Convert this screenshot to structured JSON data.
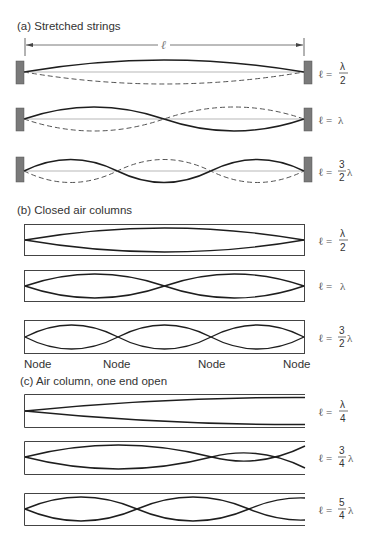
{
  "sections": [
    {
      "id": "a",
      "title": "(a)  Stretched strings",
      "length_label": "ℓ",
      "rows": [
        {
          "equation_lhs": "ℓ =",
          "numerator": "λ",
          "denominator": "2",
          "suffix": "",
          "half_loops": 1
        },
        {
          "equation_lhs": "ℓ =",
          "numerator": "",
          "denominator": "",
          "suffix": "λ",
          "half_loops": 2
        },
        {
          "equation_lhs": "ℓ =",
          "numerator": "3",
          "denominator": "2",
          "suffix": "λ",
          "half_loops": 3
        }
      ]
    },
    {
      "id": "b",
      "title": "(b)  Closed air columns",
      "rows": [
        {
          "equation_lhs": "ℓ =",
          "numerator": "λ",
          "denominator": "2",
          "suffix": "",
          "half_loops": 1
        },
        {
          "equation_lhs": "ℓ =",
          "numerator": "",
          "denominator": "",
          "suffix": "λ",
          "half_loops": 2
        },
        {
          "equation_lhs": "ℓ =",
          "numerator": "3",
          "denominator": "2",
          "suffix": "λ",
          "half_loops": 3
        }
      ],
      "node_labels": [
        "Node",
        "Node",
        "Node",
        "Node"
      ]
    },
    {
      "id": "c",
      "title": "(c) Air column, one end open",
      "rows": [
        {
          "equation_lhs": "ℓ =",
          "numerator": "λ",
          "denominator": "4",
          "suffix": "",
          "quarter_loops": 1
        },
        {
          "equation_lhs": "ℓ =",
          "numerator": "3",
          "denominator": "4",
          "suffix": "λ",
          "quarter_loops": 3
        },
        {
          "equation_lhs": "ℓ =",
          "numerator": "5",
          "denominator": "4",
          "suffix": "λ",
          "quarter_loops": 5
        }
      ]
    }
  ],
  "colors": {
    "line": "#1e1e1e",
    "dashed": "#555555",
    "clamp": "#7a7a7a",
    "box": "#444444"
  }
}
